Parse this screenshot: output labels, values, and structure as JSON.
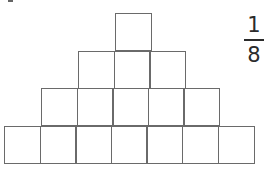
{
  "figure": {
    "line_color": "#6a6a6a",
    "text_color": "#2b2b2b",
    "background_color": "#ffffff",
    "unit_square_px": 37,
    "total_squares": 16,
    "rows": [
      {
        "row_index": 1,
        "squares": 1,
        "label": "top-row"
      },
      {
        "row_index": 2,
        "squares": 3,
        "label": "second-row"
      },
      {
        "row_index": 3,
        "squares": 5,
        "label": "third-row"
      },
      {
        "row_index": 4,
        "squares": 7,
        "label": "bottom-row"
      }
    ]
  },
  "annotation": {
    "fraction": {
      "numerator": "1",
      "denominator": "8",
      "display": "1/8"
    }
  },
  "chart_data": {
    "type": "bar",
    "title": "",
    "categories": [
      "Row 1",
      "Row 2",
      "Row 3",
      "Row 4"
    ],
    "values": [
      1,
      3,
      5,
      7
    ],
    "xlabel": "",
    "ylabel": "Unit squares",
    "ylim": [
      0,
      7
    ]
  }
}
